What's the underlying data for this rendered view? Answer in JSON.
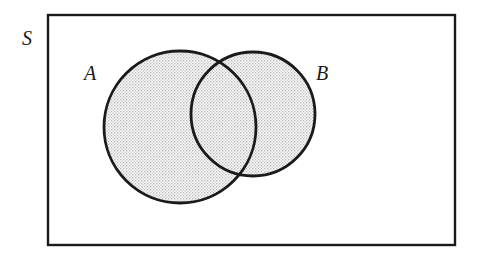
{
  "figure": {
    "type": "venn-diagram",
    "background_color": "#ffffff",
    "stroke_color": "#1a1a1a",
    "fill_pattern": "stipple-dots",
    "fill_color": "#ededed",
    "dot_color": "#8d8d8d"
  },
  "universe": {
    "label": "S",
    "shape": "rectangle",
    "x": 48,
    "y": 15,
    "width": 407,
    "height": 230,
    "stroke_width": 2.4,
    "label_x": 27,
    "label_y": 45,
    "label_font_size": 20,
    "shaded": false
  },
  "sets": [
    {
      "name": "set-a",
      "label": "A",
      "cx": 180,
      "cy": 127,
      "r": 76,
      "stroke_width": 2.8,
      "shaded": true,
      "label_x": 90,
      "label_y": 80,
      "label_font_size": 20
    },
    {
      "name": "set-b",
      "label": "B",
      "cx": 253,
      "cy": 114,
      "r": 62,
      "stroke_width": 2.8,
      "shaded": true,
      "label_x": 322,
      "label_y": 80,
      "label_font_size": 20
    }
  ],
  "regions": {
    "intersection_shaded": true,
    "union_shaded": true,
    "complement_shaded": false,
    "description": "Both circles A and B are shaded with a stipple pattern; their union is shaded, the region of S outside both circles is unshaded white."
  }
}
